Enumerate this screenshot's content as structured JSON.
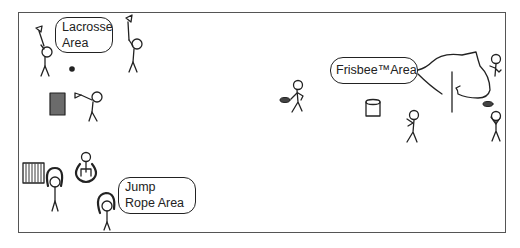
{
  "scene": {
    "title": "Playground activity areas",
    "labels": {
      "lacrosse": {
        "line1": "Lacrosse",
        "line2": "Area"
      },
      "jump_rope": {
        "line1": "Jump",
        "line2": "Rope Area"
      },
      "frisbee": {
        "text": "Frisbee™Area"
      }
    },
    "colors": {
      "ink": "#222222",
      "frame": "#555555",
      "goal_fill": "#6b6b6b",
      "background": "#ffffff"
    },
    "icons": [
      "stick-figure-icon",
      "lacrosse-stick-icon",
      "ball-icon",
      "goal-icon",
      "jump-rope-icon",
      "frisbee-icon",
      "trash-can-icon",
      "tree-icon",
      "bench-icon"
    ]
  }
}
